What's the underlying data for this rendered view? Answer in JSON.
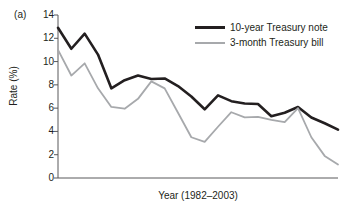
{
  "figure": {
    "panel_label": "(a)",
    "accent_colors": {
      "note_line": "#231f20",
      "bill_line": "#a7a9ac",
      "axis": "#58595b",
      "background": "#ffffff"
    }
  },
  "chart_data": {
    "type": "line",
    "title": "",
    "subtitle": "",
    "xlabel": "Year (1982–2003)",
    "ylabel": "Rate (%)",
    "ylim": [
      0,
      14
    ],
    "xlim": [
      1982,
      2003
    ],
    "yticks": [
      0,
      2,
      4,
      6,
      8,
      10,
      12,
      14
    ],
    "ytick_labels": [
      "0",
      "2",
      "4",
      "6",
      "8",
      "10",
      "12",
      "14"
    ],
    "xticks": [],
    "xtick_labels": [],
    "grid": false,
    "legend_position": "top-right",
    "x": [
      1982,
      1983,
      1984,
      1985,
      1986,
      1987,
      1988,
      1989,
      1990,
      1991,
      1992,
      1993,
      1994,
      1995,
      1996,
      1997,
      1998,
      1999,
      2000,
      2001,
      2002,
      2003
    ],
    "series": [
      {
        "name": "10-year Treasury note",
        "color": "#231f20",
        "width": 2.6,
        "values": [
          12.9,
          11.1,
          12.4,
          10.6,
          7.7,
          8.4,
          8.8,
          8.5,
          8.55,
          7.9,
          7.0,
          5.9,
          7.1,
          6.6,
          6.4,
          6.35,
          5.3,
          5.6,
          6.1,
          5.2,
          4.7,
          4.15
        ]
      },
      {
        "name": "3-month Treasury bill",
        "color": "#a7a9ac",
        "width": 1.8,
        "values": [
          11.0,
          8.8,
          9.85,
          7.7,
          6.1,
          5.95,
          6.8,
          8.3,
          7.7,
          5.6,
          3.5,
          3.1,
          4.4,
          5.65,
          5.2,
          5.25,
          5.0,
          4.8,
          6.0,
          3.5,
          1.9,
          1.15
        ]
      }
    ],
    "legend": [
      {
        "label": "10-year Treasury note",
        "color": "#231f20",
        "style": "thick-solid"
      },
      {
        "label": "3-month Treasury bill",
        "color": "#a7a9ac",
        "style": "thin-solid"
      }
    ]
  },
  "axis_geometry": {
    "plot_left": 58,
    "plot_right": 338,
    "plot_top": 15,
    "plot_bottom": 178
  }
}
